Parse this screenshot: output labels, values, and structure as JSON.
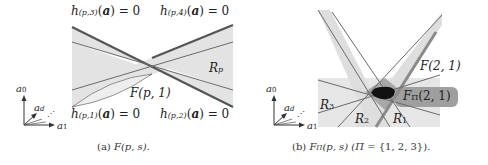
{
  "panel_a": {
    "caption": {
      "prefix": "(a) ",
      "func": "F",
      "args": "(p, s)."
    },
    "labels": {
      "h3": {
        "h": "h",
        "sub": "(p,3)",
        "rest": "(",
        "a": "a",
        "tail": ") = 0"
      },
      "h4": {
        "h": "h",
        "sub": "(p,4)",
        "rest": "(",
        "a": "a",
        "tail": ") = 0"
      },
      "h1": {
        "h": "h",
        "sub": "(p,1)",
        "rest": "(",
        "a": "a",
        "tail": ") = 0"
      },
      "h2": {
        "h": "h",
        "sub": "(p,2)",
        "rest": "(",
        "a": "a",
        "tail": ") = 0"
      },
      "Rp": {
        "R": "R",
        "sub": "p"
      },
      "Fp1": "F(p, 1)"
    },
    "axes": {
      "a0": {
        "a": "a",
        "sub": "0"
      },
      "ad": {
        "a": "a",
        "sub": "d"
      },
      "a1": {
        "a": "a",
        "sub": "1"
      },
      "dots": "⋰"
    }
  },
  "panel_b": {
    "caption": {
      "prefix": "(b) ",
      "func": "F",
      "func_sub": "Π",
      "args": "(p, s) (",
      "pi": "Π",
      "set": " = {1, 2, 3})."
    },
    "labels": {
      "R1": {
        "R": "R",
        "sub": "1"
      },
      "R2": {
        "R": "R",
        "sub": "2"
      },
      "R3": {
        "R": "R",
        "sub": "3"
      },
      "F21": "F(2, 1)",
      "FPi21": {
        "F": "F",
        "sub": "Π",
        "rest": "(2, 1)"
      }
    },
    "axes": {
      "a0": {
        "a": "a",
        "sub": "0"
      },
      "ad": {
        "a": "a",
        "sub": "d"
      },
      "a1": {
        "a": "a",
        "sub": "1"
      },
      "dots": "⋰"
    }
  },
  "colors": {
    "band": "#e3e3e3",
    "line": "#6a6a6a",
    "thick": "#5a5a5a",
    "overlap": "#b9b9b9",
    "overlap2": "#9a9a9a",
    "core": "#111111",
    "highlight": "#9c9c9c"
  }
}
